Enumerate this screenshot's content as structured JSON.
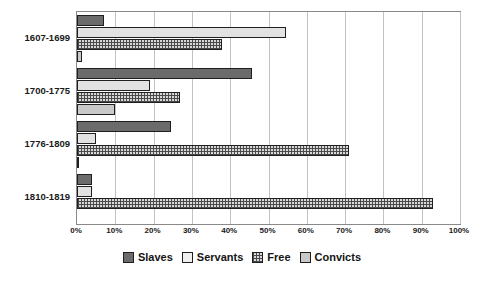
{
  "chart_data": {
    "type": "bar",
    "orientation": "horizontal",
    "title": "",
    "subtitle": "",
    "xlabel": "",
    "ylabel": "",
    "xlim": [
      0,
      100
    ],
    "x_tick_labels": [
      "0%",
      "10%",
      "20%",
      "30%",
      "40%",
      "50%",
      "60%",
      "70%",
      "80%",
      "90%",
      "100%"
    ],
    "x_tick_values": [
      0,
      10,
      20,
      30,
      40,
      50,
      60,
      70,
      80,
      90,
      100
    ],
    "grid": "vertical",
    "legend_position": "bottom",
    "categories": [
      "1607-1699",
      "1700-1775",
      "1776-1809",
      "1810-1819"
    ],
    "series": [
      {
        "name": "Slaves",
        "color": "#6b6b6b",
        "pattern": "solid-dark",
        "values": [
          7,
          45.7,
          24.5,
          4
        ]
      },
      {
        "name": "Servants",
        "color": "#e2e2e2",
        "pattern": "solid-light",
        "values": [
          54.5,
          19,
          5,
          4
        ]
      },
      {
        "name": "Free",
        "color": "#d9d9d9",
        "pattern": "crosshatch",
        "values": [
          37.9,
          27,
          71,
          93
        ]
      },
      {
        "name": "Convicts",
        "color": "#c9c9c9",
        "pattern": "solid-gray",
        "values": [
          1.2,
          10,
          0.3,
          0
        ]
      }
    ]
  },
  "legend": {
    "items": [
      {
        "label": "Slaves"
      },
      {
        "label": "Servants"
      },
      {
        "label": "Free"
      },
      {
        "label": "Convicts"
      }
    ]
  },
  "axis": {
    "ticks": [
      {
        "label": "0%"
      },
      {
        "label": "10%"
      },
      {
        "label": "20%"
      },
      {
        "label": "30%"
      },
      {
        "label": "40%"
      },
      {
        "label": "50%"
      },
      {
        "label": "60%"
      },
      {
        "label": "70%"
      },
      {
        "label": "80%"
      },
      {
        "label": "90%"
      },
      {
        "label": "100%"
      }
    ]
  },
  "colors": {
    "slaves": "#6b6b6b",
    "servants": "#e2e2e2",
    "free": "#d9d9d9",
    "convicts": "#c9c9c9",
    "grid": "#c2c2c2",
    "frame": "#8a8a8a",
    "bar_outline": "#1f1f1f",
    "text": "#1a1a1a",
    "background": "#ffffff"
  }
}
